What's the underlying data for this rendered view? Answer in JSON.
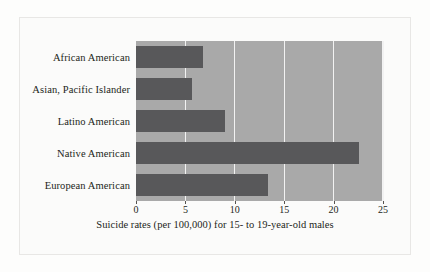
{
  "chart_data": {
    "type": "bar",
    "orientation": "horizontal",
    "title": "",
    "xlabel": "Suicide rates (per 100,000) for 15- to 19-year-old males",
    "ylabel": "",
    "categories": [
      "African American",
      "Asian, Pacific Islander",
      "Latino American",
      "Native American",
      "European American"
    ],
    "values": [
      6.8,
      5.7,
      9.0,
      22.6,
      13.4
    ],
    "xlim": [
      0,
      25
    ],
    "xticks": [
      0,
      5,
      10,
      15,
      20,
      25
    ],
    "xtick_labels": [
      "0",
      "5",
      "10",
      "15",
      "20",
      "25"
    ],
    "grid": true,
    "grid_axis": "x",
    "legend": false,
    "colors": {
      "bar": "#58585a",
      "plot_background": "#a9a9a9",
      "gridline": "#f2f2f2",
      "page_background": "#fbfbfa",
      "frame": "#e8e7e5",
      "text": "#231f20"
    }
  }
}
